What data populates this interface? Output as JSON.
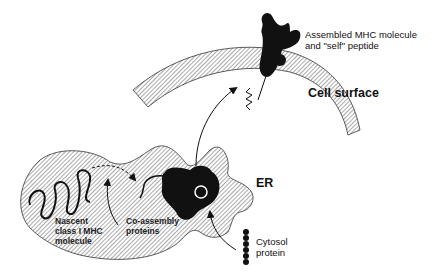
{
  "diagram": {
    "type": "biological pathway illustration",
    "colors": {
      "ink": "#111111",
      "background": "#ffffff",
      "hatch": "#555555"
    },
    "labels": {
      "assembled_line1": "Assembled MHC molecule",
      "assembled_line2": "and \"self\" peptide",
      "cell_surface": "Cell surface",
      "er": "ER",
      "cytosol_line1": "Cytosol",
      "cytosol_line2": "protein",
      "nascent_line1": "Nascent",
      "nascent_line2": "class I MHC",
      "nascent_line3": "molecule",
      "coassembly_line1": "Co-assembly",
      "coassembly_line2": "proteins"
    },
    "nodes": [
      {
        "id": "cell-surface",
        "label": "Cell surface",
        "shape": "hatched arc (membrane)"
      },
      {
        "id": "er",
        "label": "ER",
        "shape": "hatched irregular blob"
      },
      {
        "id": "nascent-mhc",
        "label": "Nascent class I MHC molecule",
        "shape": "squiggle chain"
      },
      {
        "id": "coassembly",
        "label": "Co-assembly proteins",
        "shape": "curved chain"
      },
      {
        "id": "complex",
        "label": "MHC complex in ER",
        "shape": "black blob with peptide pocket"
      },
      {
        "id": "cytosol-protein",
        "label": "Cytosol protein",
        "shape": "bead chain"
      },
      {
        "id": "assembled-mhc",
        "label": "Assembled MHC molecule and \"self\" peptide",
        "shape": "black Y-shape on membrane"
      }
    ],
    "edges": [
      {
        "from": "nascent-mhc",
        "to": "complex",
        "style": "dashed curved arrow"
      },
      {
        "from": "coassembly",
        "to": "nascent-mhc",
        "style": "curved arrow"
      },
      {
        "from": "cytosol-protein",
        "to": "complex",
        "style": "curved arrow"
      },
      {
        "from": "complex",
        "to": "cell-surface",
        "style": "curved arrow"
      }
    ]
  }
}
